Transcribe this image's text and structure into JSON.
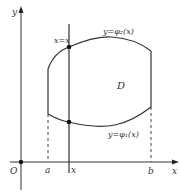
{
  "diagram": {
    "axes": {
      "x_label": "x",
      "y_label": "y",
      "origin_label": "O"
    },
    "ticks": {
      "a": "a",
      "x": "x",
      "b": "b"
    },
    "labels": {
      "vertical_line": "x=x",
      "upper_curve": "y=φ₂(x)",
      "lower_curve": "y=φ₁(x)",
      "region": "D"
    },
    "colors": {
      "line": "#333333",
      "background": "#ffffff"
    }
  }
}
